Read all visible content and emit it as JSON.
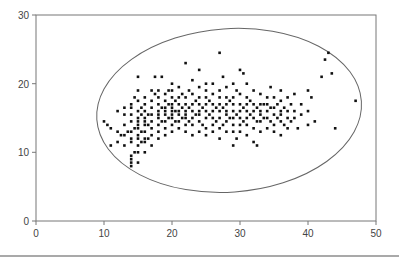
{
  "chart_data": {
    "type": "scatter",
    "title": "",
    "xlabel": "",
    "ylabel": "",
    "xlim": [
      0,
      50
    ],
    "ylim": [
      0,
      30
    ],
    "x_ticks": [
      0,
      10,
      20,
      30,
      40,
      50
    ],
    "y_ticks": [
      0,
      10,
      20,
      30
    ],
    "x_tick_labels": [
      "0",
      "10",
      "20",
      "30",
      "40",
      "50"
    ],
    "y_tick_labels": [
      "0",
      "10",
      "20",
      "30"
    ],
    "grid": false,
    "legend": null,
    "marker": "square",
    "marker_color": "#111111",
    "annotations": [
      {
        "type": "ellipse",
        "cx": 28.4,
        "cy": 16.1,
        "rx": 19.5,
        "ry": 11.9,
        "rotation_deg": -4,
        "stroke": "#666666",
        "description": "ellipse enclosing the point cloud"
      }
    ],
    "series": [
      {
        "name": "points",
        "points": [
          [
            10,
            14.5
          ],
          [
            10.5,
            14
          ],
          [
            11,
            11
          ],
          [
            11,
            13.5
          ],
          [
            12,
            11.5
          ],
          [
            12,
            13
          ],
          [
            12,
            16
          ],
          [
            12.5,
            12.5
          ],
          [
            13,
            11
          ],
          [
            13,
            14
          ],
          [
            13,
            15.5
          ],
          [
            13,
            16.5
          ],
          [
            13,
            12.5
          ],
          [
            13.5,
            13
          ],
          [
            14,
            8
          ],
          [
            14,
            8.5
          ],
          [
            14,
            9
          ],
          [
            14,
            9.5
          ],
          [
            14,
            11.5
          ],
          [
            14,
            12
          ],
          [
            14,
            13
          ],
          [
            14,
            14.5
          ],
          [
            14,
            15.5
          ],
          [
            14,
            16.5
          ],
          [
            14,
            17
          ],
          [
            14.5,
            10
          ],
          [
            14.5,
            13.5
          ],
          [
            14.5,
            18
          ],
          [
            15,
            8.5
          ],
          [
            15,
            10
          ],
          [
            15,
            11
          ],
          [
            15,
            12
          ],
          [
            15,
            12.5
          ],
          [
            15,
            13.5
          ],
          [
            15,
            14
          ],
          [
            15,
            14.5
          ],
          [
            15,
            15
          ],
          [
            15,
            16
          ],
          [
            15,
            17.5
          ],
          [
            15,
            19
          ],
          [
            15,
            21
          ],
          [
            15.5,
            11.5
          ],
          [
            15.5,
            13
          ],
          [
            15.5,
            15.5
          ],
          [
            15.5,
            16.5
          ],
          [
            16,
            10
          ],
          [
            16,
            11.5
          ],
          [
            16,
            12
          ],
          [
            16,
            13
          ],
          [
            16,
            14
          ],
          [
            16,
            14.5
          ],
          [
            16,
            15
          ],
          [
            16,
            16
          ],
          [
            16,
            17
          ],
          [
            16,
            18
          ],
          [
            16.5,
            12
          ],
          [
            16.5,
            14
          ],
          [
            16.5,
            15.5
          ],
          [
            17,
            11
          ],
          [
            17,
            12.5
          ],
          [
            17,
            13.5
          ],
          [
            17,
            14.5
          ],
          [
            17,
            15.5
          ],
          [
            17,
            16.5
          ],
          [
            17,
            17.5
          ],
          [
            17,
            19
          ],
          [
            17.5,
            21
          ],
          [
            17.5,
            18.5
          ],
          [
            18,
            12
          ],
          [
            18,
            13
          ],
          [
            18,
            14
          ],
          [
            18,
            15
          ],
          [
            18,
            15.5
          ],
          [
            18,
            16
          ],
          [
            18,
            17
          ],
          [
            18,
            18
          ],
          [
            18,
            19
          ],
          [
            18.5,
            21
          ],
          [
            18.5,
            14.5
          ],
          [
            18.5,
            16.5
          ],
          [
            19,
            12.5
          ],
          [
            19,
            13.5
          ],
          [
            19,
            14.5
          ],
          [
            19,
            15.5
          ],
          [
            19,
            16
          ],
          [
            19,
            16.5
          ],
          [
            19,
            17.5
          ],
          [
            19,
            18.5
          ],
          [
            19.5,
            15
          ],
          [
            19.5,
            17
          ],
          [
            19.5,
            19
          ],
          [
            20,
            13
          ],
          [
            20,
            14
          ],
          [
            20,
            15
          ],
          [
            20,
            15.5
          ],
          [
            20,
            16
          ],
          [
            20,
            16.5
          ],
          [
            20,
            17
          ],
          [
            20,
            18
          ],
          [
            20,
            19
          ],
          [
            20,
            20
          ],
          [
            20.5,
            14.5
          ],
          [
            20.5,
            16
          ],
          [
            20.5,
            17.5
          ],
          [
            21,
            13.5
          ],
          [
            21,
            14.5
          ],
          [
            21,
            15.5
          ],
          [
            21,
            16
          ],
          [
            21,
            17
          ],
          [
            21,
            18
          ],
          [
            21,
            19.5
          ],
          [
            21.5,
            15
          ],
          [
            21.5,
            16.5
          ],
          [
            21.5,
            18.5
          ],
          [
            22,
            13
          ],
          [
            22,
            14
          ],
          [
            22,
            15
          ],
          [
            22,
            15.5
          ],
          [
            22,
            16
          ],
          [
            22,
            17
          ],
          [
            22,
            18
          ],
          [
            22,
            23
          ],
          [
            22.5,
            14.5
          ],
          [
            22.5,
            16.5
          ],
          [
            22.5,
            19
          ],
          [
            23,
            12.5
          ],
          [
            23,
            14
          ],
          [
            23,
            15
          ],
          [
            23,
            16
          ],
          [
            23,
            17
          ],
          [
            23,
            18.5
          ],
          [
            23,
            20.5
          ],
          [
            23.5,
            15.5
          ],
          [
            23.5,
            17.5
          ],
          [
            24,
            13
          ],
          [
            24,
            14.5
          ],
          [
            24,
            15.5
          ],
          [
            24,
            16
          ],
          [
            24,
            17
          ],
          [
            24,
            18
          ],
          [
            24,
            19.5
          ],
          [
            24,
            22
          ],
          [
            24.5,
            14
          ],
          [
            24.5,
            16.5
          ],
          [
            25,
            12.5
          ],
          [
            25,
            13.5
          ],
          [
            25,
            15
          ],
          [
            25,
            16
          ],
          [
            25,
            17
          ],
          [
            25,
            18
          ],
          [
            25,
            19
          ],
          [
            25,
            20
          ],
          [
            25.5,
            15.5
          ],
          [
            25.5,
            17.5
          ],
          [
            26,
            13
          ],
          [
            26,
            14
          ],
          [
            26,
            15
          ],
          [
            26,
            16
          ],
          [
            26,
            17
          ],
          [
            26,
            18.5
          ],
          [
            26,
            20
          ],
          [
            26.5,
            14.5
          ],
          [
            26.5,
            16.5
          ],
          [
            27,
            12
          ],
          [
            27,
            13.5
          ],
          [
            27,
            15
          ],
          [
            27,
            16
          ],
          [
            27,
            17
          ],
          [
            27,
            18
          ],
          [
            27,
            19
          ],
          [
            27,
            24.5
          ],
          [
            27.5,
            14
          ],
          [
            27.5,
            16.5
          ],
          [
            27.5,
            21
          ],
          [
            28,
            13
          ],
          [
            28,
            14.5
          ],
          [
            28,
            15.5
          ],
          [
            28,
            16
          ],
          [
            28,
            17
          ],
          [
            28,
            18
          ],
          [
            28,
            19.5
          ],
          [
            28.5,
            15
          ],
          [
            28.5,
            17.5
          ],
          [
            29,
            11
          ],
          [
            29,
            13
          ],
          [
            29,
            14
          ],
          [
            29,
            15
          ],
          [
            29,
            16
          ],
          [
            29,
            17
          ],
          [
            29,
            18
          ],
          [
            29,
            20
          ],
          [
            29.5,
            12
          ],
          [
            29.5,
            15.5
          ],
          [
            29.5,
            19
          ],
          [
            30,
            13
          ],
          [
            30,
            14
          ],
          [
            30,
            15
          ],
          [
            30,
            16
          ],
          [
            30,
            17
          ],
          [
            30,
            18.5
          ],
          [
            30,
            22
          ],
          [
            30.5,
            14.5
          ],
          [
            30.5,
            16.5
          ],
          [
            30.5,
            21.5
          ],
          [
            31,
            12.5
          ],
          [
            31,
            14
          ],
          [
            31,
            15
          ],
          [
            31,
            16
          ],
          [
            31,
            17
          ],
          [
            31,
            18
          ],
          [
            31,
            20
          ],
          [
            31.5,
            15.5
          ],
          [
            31.5,
            17.5
          ],
          [
            32,
            11.5
          ],
          [
            32,
            13.5
          ],
          [
            32,
            15
          ],
          [
            32,
            16
          ],
          [
            32,
            17
          ],
          [
            32,
            19
          ],
          [
            32.5,
            11
          ],
          [
            32.5,
            14.5
          ],
          [
            32.5,
            16.5
          ],
          [
            33,
            13
          ],
          [
            33,
            14.5
          ],
          [
            33,
            15.5
          ],
          [
            33,
            16
          ],
          [
            33,
            17
          ],
          [
            33,
            18.5
          ],
          [
            33.5,
            15
          ],
          [
            33.5,
            17
          ],
          [
            34,
            13.5
          ],
          [
            34,
            15
          ],
          [
            34,
            16
          ],
          [
            34,
            17
          ],
          [
            34,
            18
          ],
          [
            34.5,
            14.5
          ],
          [
            34.5,
            16.5
          ],
          [
            34.5,
            19.5
          ],
          [
            35,
            13
          ],
          [
            35,
            14
          ],
          [
            35,
            15.5
          ],
          [
            35,
            16.5
          ],
          [
            35,
            18
          ],
          [
            35.5,
            15
          ],
          [
            35.5,
            17
          ],
          [
            36,
            12.5
          ],
          [
            36,
            14.5
          ],
          [
            36,
            15.5
          ],
          [
            36,
            16
          ],
          [
            36,
            17.5
          ],
          [
            36,
            19
          ],
          [
            36.5,
            14
          ],
          [
            36.5,
            16.5
          ],
          [
            37,
            13.5
          ],
          [
            37,
            15
          ],
          [
            37,
            16
          ],
          [
            37,
            18
          ],
          [
            37.5,
            14.5
          ],
          [
            37.5,
            17
          ],
          [
            38,
            15
          ],
          [
            38,
            16
          ],
          [
            38,
            18.5
          ],
          [
            38.5,
            13.5
          ],
          [
            39,
            15.5
          ],
          [
            39,
            17
          ],
          [
            40,
            14
          ],
          [
            40,
            16
          ],
          [
            40,
            19
          ],
          [
            40.5,
            18
          ],
          [
            41,
            14.5
          ],
          [
            42,
            21
          ],
          [
            42.5,
            23.5
          ],
          [
            43,
            24.5
          ],
          [
            43.5,
            21.5
          ],
          [
            44,
            13.5
          ],
          [
            47,
            17.5
          ]
        ]
      }
    ]
  },
  "axes": {
    "x_ticks": [
      {
        "label": "0"
      },
      {
        "label": "10"
      },
      {
        "label": "20"
      },
      {
        "label": "30"
      },
      {
        "label": "40"
      },
      {
        "label": "50"
      }
    ],
    "y_ticks": [
      {
        "label": "0"
      },
      {
        "label": "10"
      },
      {
        "label": "20"
      },
      {
        "label": "30"
      }
    ]
  }
}
